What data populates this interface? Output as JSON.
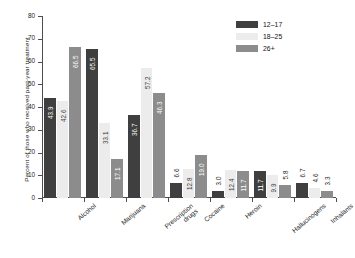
{
  "chart_data": {
    "type": "bar",
    "title": "",
    "xlabel": "",
    "ylabel": "Percent of those who received past-year treatment",
    "ylim": [
      0,
      80
    ],
    "yticks": [
      0,
      10,
      20,
      30,
      40,
      50,
      60,
      70,
      80
    ],
    "ytick_labels": [
      "0",
      "10",
      "20",
      "30",
      "40",
      "50",
      "60",
      "70",
      "80"
    ],
    "grid": false,
    "legend_position": "top-right",
    "categories": [
      "Alcohol",
      "Marijuana",
      "Prescription drugs",
      "Cocaine",
      "Heroin",
      "Hallucinogens",
      "Inhalants"
    ],
    "category_lines": [
      [
        "Alcohol"
      ],
      [
        "Marijuana"
      ],
      [
        "Prescription",
        "drugs"
      ],
      [
        "Cocaine"
      ],
      [
        "Heroin"
      ],
      [
        "Hallucinogens"
      ],
      [
        "Inhalants"
      ]
    ],
    "series": [
      {
        "name": "12–17",
        "color": "#3f3f3f",
        "values": [
          43.9,
          65.5,
          36.7,
          6.6,
          3.0,
          11.7,
          6.7
        ],
        "labels": [
          "43.9",
          "65.5",
          "36.7",
          "6.6",
          "3.0",
          "11.7",
          "6.7"
        ]
      },
      {
        "name": "18–25",
        "color": "#ececec",
        "values": [
          42.6,
          33.1,
          57.2,
          12.8,
          12.4,
          9.9,
          4.6
        ],
        "labels": [
          "42.6",
          "33.1",
          "57.2",
          "12.8",
          "12.4",
          "9.9",
          "4.6"
        ]
      },
      {
        "name": "26+",
        "color": "#8c8c8c",
        "values": [
          66.5,
          17.1,
          46.3,
          19.0,
          11.7,
          5.8,
          3.3
        ],
        "labels": [
          "66.5",
          "17.1",
          "46.3",
          "19.0",
          "11.7",
          "5.8",
          "3.3"
        ]
      }
    ]
  },
  "legend": {
    "items": [
      {
        "label": "12–17",
        "color": "#3f3f3f"
      },
      {
        "label": "18–25",
        "color": "#ececec"
      },
      {
        "label": "26+",
        "color": "#8c8c8c"
      }
    ]
  }
}
